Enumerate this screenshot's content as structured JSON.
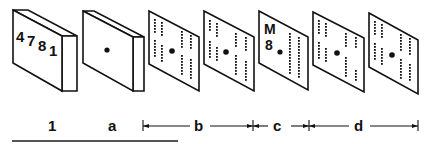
{
  "diagram": {
    "cards": [
      {
        "id": "1",
        "type": "block",
        "text": "4781",
        "has_center_dot": false
      },
      {
        "id": "a",
        "type": "block",
        "text": "",
        "has_center_dot": true
      },
      {
        "id": "b1",
        "type": "perforated",
        "group": "b",
        "has_center_dot": true
      },
      {
        "id": "b2",
        "type": "perforated",
        "group": "b",
        "has_center_dot": true
      },
      {
        "id": "c",
        "type": "marked",
        "group": "c",
        "text_top": "M",
        "text_bottom": "8",
        "has_center_dot": true
      },
      {
        "id": "d1",
        "type": "perforated",
        "group": "d",
        "has_center_dot": true
      },
      {
        "id": "d2",
        "type": "perforated",
        "group": "d",
        "has_center_dot": true
      }
    ],
    "labels": {
      "item_1": "1",
      "item_a": "a",
      "span_b": "b",
      "span_c": "c",
      "span_d": "d"
    },
    "card1_digits": [
      "4",
      "7",
      "8",
      "1"
    ],
    "colors": {
      "ink": "#111111",
      "background": "#ffffff",
      "baseline": "#555555"
    }
  }
}
